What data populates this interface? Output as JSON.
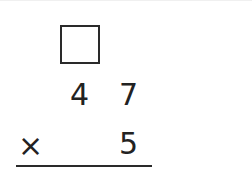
{
  "problem": {
    "type": "vertical-multiplication",
    "carry_box": "",
    "multiplicand_digits": [
      "4",
      "7"
    ],
    "operator": "×",
    "multiplier": "5",
    "answer": ""
  },
  "colors": {
    "ink": "#222222",
    "background": "#ffffff"
  }
}
